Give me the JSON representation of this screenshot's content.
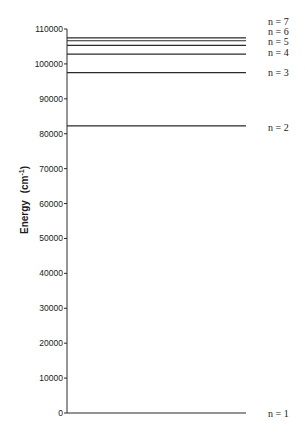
{
  "chart_data": {
    "type": "energy-level-diagram",
    "title": "",
    "xlabel": "",
    "ylabel": "Energy (cm⁻¹)",
    "ylabel_text": "Energy",
    "ylabel_unit_base": "(cm",
    "ylabel_unit_sup": "-1",
    "ylabel_unit_close": ")",
    "ylim": [
      0,
      110000
    ],
    "yticks": [
      0,
      10000,
      20000,
      30000,
      40000,
      50000,
      60000,
      70000,
      80000,
      90000,
      100000,
      110000
    ],
    "grid": false,
    "legend": null,
    "levels": [
      {
        "label": "n = 1",
        "value": 0
      },
      {
        "label": "n = 2",
        "value": 82259
      },
      {
        "label": "n = 3",
        "value": 97492
      },
      {
        "label": "n = 4",
        "value": 102824
      },
      {
        "label": "n = 5",
        "value": 105292
      },
      {
        "label": "n = 6",
        "value": 106632
      },
      {
        "label": "n = 7",
        "value": 107440
      }
    ]
  },
  "layout": {
    "axis_x": 67,
    "y_zero_px": 413,
    "y_top_px": 29,
    "line_end_x": 246,
    "label_x": 268,
    "label_positions_px": [
      413,
      127,
      72,
      52,
      41,
      31,
      21
    ],
    "line_color": "#2a2a2a"
  }
}
